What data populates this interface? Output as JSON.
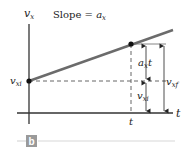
{
  "diagram": {
    "axes": {
      "y_label": "v",
      "y_label_sub": "x",
      "x_label": "t"
    },
    "slope_label": {
      "prefix": "Slope = ",
      "var": "a",
      "sub": "x"
    },
    "point_labels": {
      "v_xi_left": {
        "var": "v",
        "sub": "xi"
      },
      "t_tick": "t"
    },
    "measurements": {
      "a_x_t": {
        "var": "a",
        "sub": "x",
        "suffix": "t"
      },
      "v_xi": {
        "var": "v",
        "sub": "xi"
      },
      "v_xf": {
        "var": "v",
        "sub": "xf"
      }
    },
    "caption": {
      "letter": "b"
    },
    "colors": {
      "line": "#6b6b6b",
      "axis": "#333333",
      "dashed": "#555555",
      "dot": "#111111",
      "caption_box": "#9a9a9a",
      "caption_rule": "#d8d8d8"
    }
  }
}
